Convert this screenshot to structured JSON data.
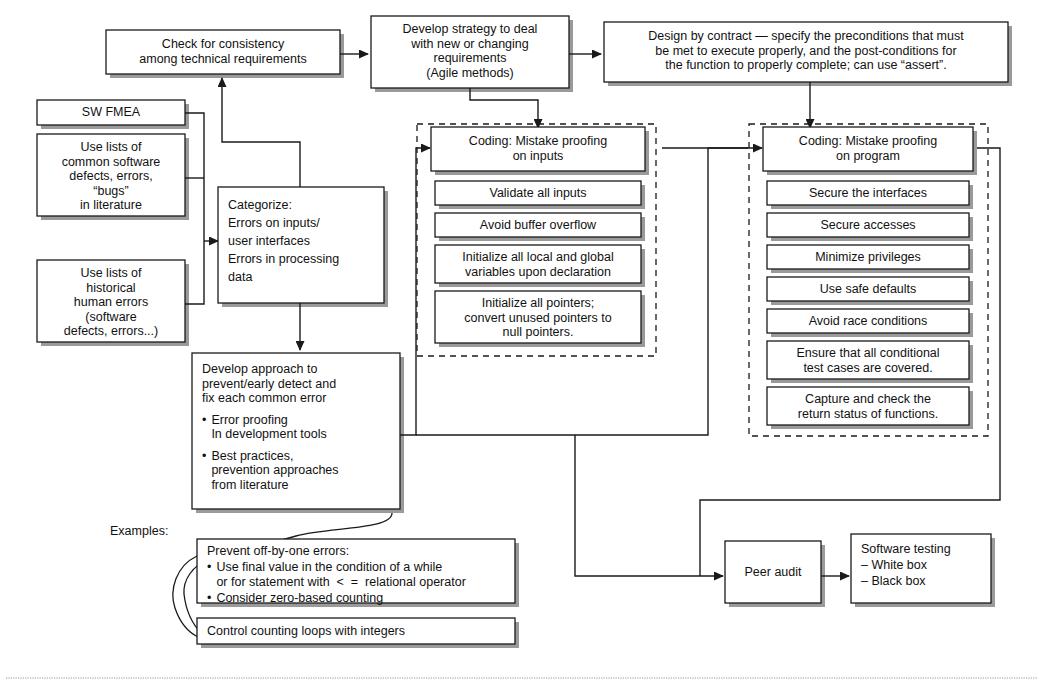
{
  "diagram": {
    "line_color": "#1a1a1a",
    "box_fill": "#ffffff",
    "shadow_color": "#9a9a9a",
    "rule_color": "#b9b9b9"
  },
  "nodes": {
    "check_consistency": {
      "lines": [
        "Check for consistency",
        "among technical requirements"
      ]
    },
    "develop_strategy": {
      "lines": [
        "Develop strategy to deal",
        "with new or changing",
        "requirements",
        "(Agile methods)"
      ]
    },
    "design_by_contract": {
      "lines": [
        "Design by contract — specify the preconditions that must",
        "be met to execute properly, and the post-conditions for",
        "the function to properly complete; can use “assert”."
      ]
    },
    "sw_fmea": {
      "lines": [
        "SW FMEA"
      ]
    },
    "use_lists_common": {
      "lines": [
        "Use lists of",
        "common software",
        "defects, errors,",
        "“bugs”",
        "in literature"
      ]
    },
    "use_lists_historical": {
      "lines": [
        "Use lists of",
        "historical",
        "human errors",
        "(software",
        "defects, errors...)"
      ]
    },
    "categorize": {
      "lines": [
        "Categorize:",
        "Errors on inputs/",
        "user interfaces",
        "Errors in processing",
        "data"
      ]
    },
    "develop_approach": {
      "heading": [
        "Develop approach to",
        "prevent/early detect and",
        "fix each common error"
      ],
      "bullets": [
        [
          "Error proofing",
          "In development tools"
        ],
        [
          "Best practices,",
          "prevention approaches",
          "from literature"
        ]
      ],
      "bullet_glyph": "•"
    },
    "examples_label": "Examples:",
    "prevent_off_by_one": {
      "heading": "Prevent off-by-one errors:",
      "bullets": [
        [
          "Use final value in the condition of a while",
          "or for statement with  <  =  relational operator"
        ],
        [
          "Consider zero-based counting"
        ]
      ],
      "bullet_glyph": "•"
    },
    "control_counting": {
      "lines": [
        "Control counting loops with integers"
      ]
    },
    "peer_audit": {
      "lines": [
        "Peer audit"
      ]
    },
    "software_testing": {
      "lines": [
        "Software testing",
        "– White box",
        "– Black box"
      ]
    }
  },
  "groups": {
    "inputs_group": {
      "header": [
        "Coding: Mistake proofing",
        "on inputs"
      ],
      "items": [
        [
          "Validate all inputs"
        ],
        [
          "Avoid buffer overflow"
        ],
        [
          "Initialize all local and global",
          "variables upon declaration"
        ],
        [
          "Initialize all pointers;",
          "convert unused pointers to",
          "null pointers."
        ]
      ]
    },
    "program_group": {
      "header": [
        "Coding: Mistake proofing",
        "on program"
      ],
      "items": [
        [
          "Secure the interfaces"
        ],
        [
          "Secure accesses"
        ],
        [
          "Minimize privileges"
        ],
        [
          "Use safe defaults"
        ],
        [
          "Avoid race conditions"
        ],
        [
          "Ensure that all conditional",
          "test cases are covered."
        ],
        [
          "Capture and check the",
          "return status of functions."
        ]
      ]
    }
  }
}
